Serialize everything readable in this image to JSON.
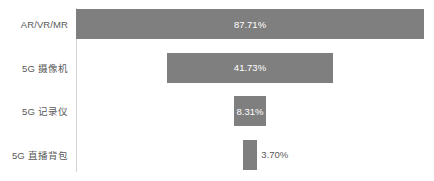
{
  "chart_data": {
    "type": "bar",
    "orientation": "horizontal",
    "title": "",
    "xlabel": "",
    "ylabel": "",
    "grid": false,
    "legend": false,
    "categories": [
      "AR/VR/MR",
      "5G 摄像机",
      "5G 记录仪",
      "5G 直播背包"
    ],
    "values": [
      87.71,
      41.73,
      8.31,
      3.7
    ],
    "value_labels": [
      "87.71%",
      "41.73%",
      "8.31%",
      "3.70%"
    ],
    "label_placement": [
      "inside",
      "inside",
      "inside",
      "outside"
    ],
    "xlim": [
      0,
      100
    ],
    "bar_color": "#7f7f7f",
    "inside_label_color": "#ffffff",
    "outside_label_color": "#595959",
    "category_label_color": "#595959",
    "axis_line_color": "#d4d4d4",
    "background_color": "#ffffff"
  }
}
